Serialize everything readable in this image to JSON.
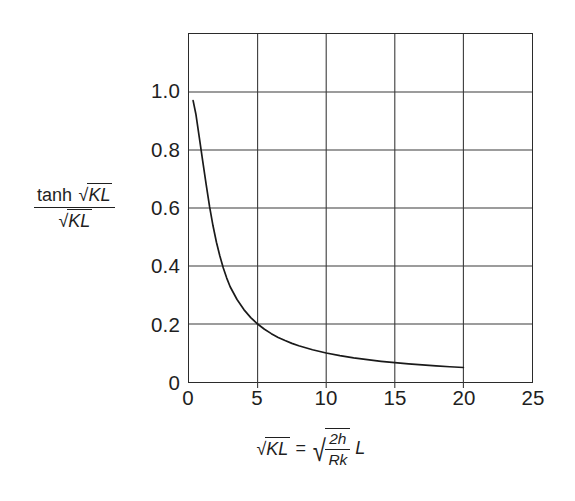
{
  "chart_data": {
    "type": "line",
    "title": "",
    "xlabel": "√KL = √(2h/Rk) L",
    "ylabel": "tanh √KL / √KL",
    "xlim": [
      0,
      25
    ],
    "ylim": [
      0,
      1.2
    ],
    "grid": true,
    "legend": null,
    "x_ticks": [
      "0",
      "5",
      "10",
      "15",
      "20",
      "25"
    ],
    "x_tick_values": [
      0,
      5,
      10,
      15,
      20,
      25
    ],
    "y_ticks": [
      "0",
      "0.2",
      "0.4",
      "0.6",
      "0.8",
      "1.0"
    ],
    "y_tick_values": [
      0,
      0.2,
      0.4,
      0.6,
      0.8,
      1.0
    ],
    "series": [
      {
        "name": "tanh(√KL)/√KL",
        "x": [
          0.3,
          0.5,
          0.75,
          1.0,
          1.25,
          1.5,
          1.75,
          2.0,
          2.25,
          2.5,
          2.75,
          3.0,
          3.5,
          4.0,
          4.5,
          5.0,
          5.5,
          6.0,
          6.5,
          7.0,
          7.5,
          8.0,
          9.0,
          10.0,
          11.0,
          12.0,
          13.0,
          14.0,
          15.0,
          16.0,
          17.0,
          18.0,
          19.0,
          20.0
        ],
        "y": [
          0.9705,
          0.9242,
          0.8436,
          0.7616,
          0.6816,
          0.6045,
          0.5387,
          0.482,
          0.4343,
          0.3932,
          0.3583,
          0.3284,
          0.2844,
          0.2497,
          0.2221,
          0.1999,
          0.1818,
          0.1667,
          0.1538,
          0.1429,
          0.1333,
          0.125,
          0.1111,
          0.1,
          0.0909,
          0.0833,
          0.0769,
          0.0714,
          0.0667,
          0.0625,
          0.0588,
          0.0556,
          0.0526,
          0.05
        ]
      }
    ],
    "axis_title_y_parts": {
      "numerator_text": "tanh",
      "numerator_radical": "KL",
      "denominator_radical": "KL"
    },
    "axis_title_x_parts": {
      "lhs_radical": "KL",
      "equals": "=",
      "rhs_numerator": "2h",
      "rhs_denominator": "Rk",
      "rhs_factor": "L"
    },
    "colors": {
      "curve": "#1a1a1a",
      "grid": "#3a3a3a",
      "frame": "#2b2b2b",
      "text": "#1f1f1f",
      "background": "#ffffff"
    }
  }
}
